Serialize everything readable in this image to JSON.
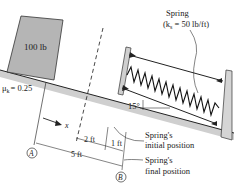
{
  "figure": {
    "type": "physics-free-body-setup",
    "block": {
      "label": "100 lb",
      "fill": "#b8b8b8"
    },
    "friction": {
      "label": "μ",
      "sub": "k",
      "value": "= 0.25"
    },
    "incline": {
      "angle_label": "15°",
      "fill": "#c8c8c8"
    },
    "spring": {
      "title": "Spring",
      "constant_prefix": "(k",
      "constant_sub": "s",
      "constant_suffix": " = 50 lb/ft)"
    },
    "axis": {
      "label": "x"
    },
    "dimensions": {
      "d1": "2 ft",
      "d2": "1 ft",
      "d3": "5 ft"
    },
    "points": {
      "a": "A",
      "b": "B"
    },
    "annotations": {
      "initial_line1": "Spring's",
      "initial_line2": "initial position",
      "final_line1": "Spring's",
      "final_line2": "final position"
    },
    "colors": {
      "line": "#222222",
      "shade": "#b8b8b8",
      "ground": "#c8c8c8"
    }
  }
}
